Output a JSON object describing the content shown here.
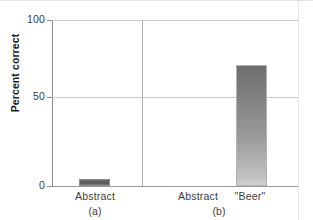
{
  "chart_data": {
    "type": "bar",
    "title": "",
    "subtitle": "",
    "xlabel": "",
    "ylabel": "Percent correct",
    "ylim": [
      0,
      100
    ],
    "yticks": [
      "0",
      "50",
      "100"
    ],
    "grid": true,
    "legend": null,
    "panels": [
      {
        "caption": "(a)",
        "categories": [
          "Abstract"
        ],
        "values": [
          4
        ]
      },
      {
        "caption": "(b)",
        "categories": [
          "Abstract",
          "\"Beer\""
        ],
        "values": [
          0,
          73
        ]
      }
    ],
    "categories": [
      "Abstract",
      "Abstract",
      "\"Beer\""
    ],
    "values": [
      4,
      0,
      73
    ],
    "colors": {
      "bar_dark": "#565656",
      "bar_gradient_top": "#6e6e6e",
      "bar_gradient_bottom": "#d2d2d2",
      "gridline": "#c9c9c9",
      "axis": "#8a8a8a",
      "text": "#3d3d3d"
    }
  },
  "axis": {
    "y_title": "Percent correct",
    "tick_100": "100",
    "tick_50": "50",
    "tick_0": "0"
  },
  "panel_a": {
    "caption": "(a)",
    "bar_abstract_label": "Abstract"
  },
  "panel_b": {
    "caption": "(b)",
    "bar_abstract_label": "Abstract",
    "bar_beer_label": "\"Beer\""
  }
}
